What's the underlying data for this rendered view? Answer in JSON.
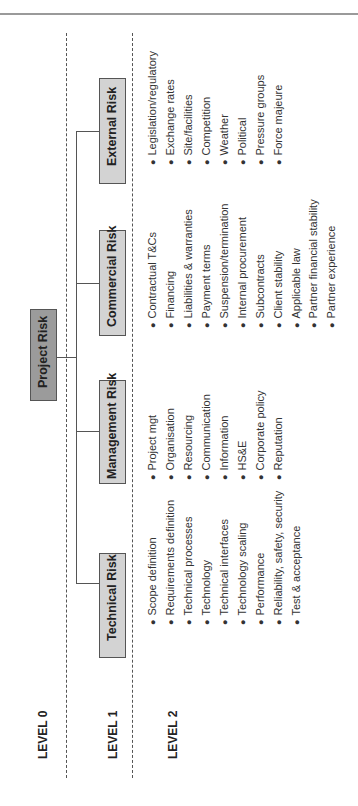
{
  "levels": {
    "level0": "LEVEL 0",
    "level1": "LEVEL 1",
    "level2": "LEVEL 2"
  },
  "root": {
    "label": "Project Risk",
    "color": "#9b9b9b"
  },
  "categories": [
    {
      "label": "External Risk",
      "items": [
        "Legislation/regulatory",
        "Exchange rates",
        "Site/facilities",
        "Competition",
        "Weather",
        "Political",
        "Pressure groups",
        "Force majeure"
      ]
    },
    {
      "label": "Commercial Risk",
      "items": [
        "Contractual T&Cs",
        "Financing",
        "Liabilities & warranties",
        "Payment terms",
        "Suspension/termination",
        "Internal procurement",
        "Subcontracts",
        "Client stability",
        "Applicable law",
        "Partner financial stability",
        "Partner experience"
      ]
    },
    {
      "label": "Management Risk",
      "items": [
        "Project mgt",
        "Organisation",
        "Resourcing",
        "Communication",
        "Information",
        "HS&E",
        "Corporate policy",
        "Reputation"
      ]
    },
    {
      "label": "Technical Risk",
      "items": [
        "Scope definition",
        "Requirements definition",
        "Technical processes",
        "Technology",
        "Technical interfaces",
        "Technology scaling",
        "Performance",
        "Reliability, safety, security",
        "Test & acceptance"
      ]
    }
  ],
  "colors": {
    "level1_box": "#d3d3d3",
    "line": "#555555",
    "border_top": "#9a9a9a"
  }
}
